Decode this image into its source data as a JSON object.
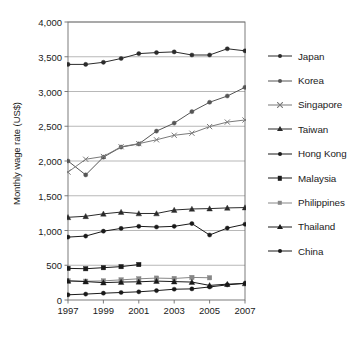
{
  "chart_data": {
    "type": "line",
    "title": "",
    "xlabel": "",
    "ylabel": "Monthly wage rate (US$)",
    "xlim": [
      1997,
      2007
    ],
    "ylim": [
      0,
      4000
    ],
    "grid": true,
    "legend_position": "right",
    "x": [
      1997,
      1998,
      1999,
      2000,
      2001,
      2002,
      2003,
      2004,
      2005,
      2006,
      2007
    ],
    "xticks": [
      "1997",
      "1999",
      "2001",
      "2003",
      "2005",
      "2007"
    ],
    "xtick_values": [
      1997,
      1999,
      2001,
      2003,
      2005,
      2007
    ],
    "yticks": [
      "0",
      "500",
      "1,000",
      "1,500",
      "2,000",
      "2,500",
      "3,000",
      "3,500",
      "4,000"
    ],
    "ytick_values": [
      0,
      500,
      1000,
      1500,
      2000,
      2500,
      3000,
      3500,
      4000
    ],
    "series": [
      {
        "name": "Japan",
        "marker": "circle",
        "color": "#2b2b2b",
        "values": [
          3390,
          3390,
          3420,
          3475,
          3545,
          3560,
          3570,
          3525,
          3525,
          3615,
          3585
        ]
      },
      {
        "name": "Korea",
        "marker": "circle",
        "color": "#555555",
        "values": [
          2000,
          1800,
          2055,
          2200,
          2245,
          2430,
          2545,
          2710,
          2845,
          2935,
          3060
        ]
      },
      {
        "name": "Singapore",
        "marker": "x",
        "color": "#7a7a7a",
        "values": [
          1840,
          2025,
          2065,
          2205,
          2250,
          2305,
          2370,
          2400,
          2495,
          2560,
          2590
        ]
      },
      {
        "name": "Taiwan",
        "marker": "triangle",
        "color": "#2b2b2b",
        "values": [
          1190,
          1205,
          1240,
          1265,
          1245,
          1245,
          1295,
          1310,
          1315,
          1325,
          1330
        ]
      },
      {
        "name": "Hong Kong",
        "marker": "circle",
        "color": "#1a1a1a",
        "values": [
          905,
          920,
          990,
          1030,
          1060,
          1050,
          1060,
          1100,
          935,
          1035,
          1090
        ]
      },
      {
        "name": "Malaysia",
        "marker": "square",
        "color": "#1a1a1a",
        "values": [
          455,
          450,
          465,
          480,
          510,
          null,
          null,
          null,
          null,
          null,
          null
        ]
      },
      {
        "name": "Philippines",
        "marker": "square",
        "color": "#878787",
        "values": [
          275,
          270,
          275,
          290,
          305,
          315,
          310,
          325,
          320,
          null,
          null
        ]
      },
      {
        "name": "Thailand",
        "marker": "triangle",
        "color": "#1a1a1a",
        "values": [
          275,
          265,
          250,
          258,
          262,
          272,
          265,
          258,
          210,
          228,
          238
        ]
      },
      {
        "name": "China",
        "marker": "circle",
        "color": "#1a1a1a",
        "values": [
          75,
          85,
          98,
          108,
          118,
          135,
          155,
          160,
          188,
          218,
          240
        ]
      }
    ]
  },
  "legend": {
    "items": [
      {
        "label": "Japan"
      },
      {
        "label": "Korea"
      },
      {
        "label": "Singapore"
      },
      {
        "label": "Taiwan"
      },
      {
        "label": "Hong Kong"
      },
      {
        "label": "Malaysia"
      },
      {
        "label": "Philippines"
      },
      {
        "label": "Thailand"
      },
      {
        "label": "China"
      }
    ]
  }
}
